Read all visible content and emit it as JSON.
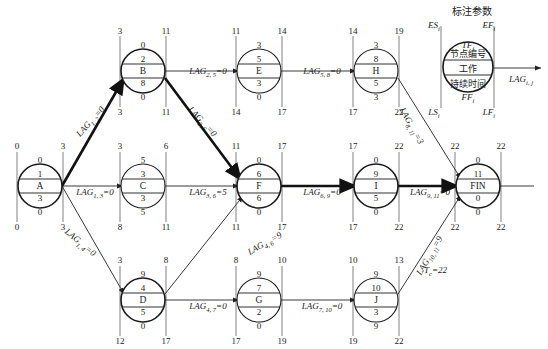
{
  "diagram": {
    "title_cn": "标注参数",
    "project_duration_label": "T",
    "project_duration_sub": "c",
    "project_duration_text": "T",
    "project_duration_value": "=22",
    "legend": {
      "es": "ES",
      "es_sub": "i",
      "ef": "EF",
      "ef_sub": "i",
      "tf": "TF",
      "tf_sub": "i",
      "ff": "FF",
      "ff_sub": "i",
      "ls": "LS",
      "ls_sub": "i",
      "lf": "LF",
      "lf_sub": "i",
      "node_id": "节点编号",
      "work": "工作",
      "duration": "持续时间",
      "lag": "LAG",
      "lag_sub": "i, j"
    },
    "nodes": [
      {
        "key": "A",
        "name": "A",
        "id": "1",
        "duration": "3",
        "tf": "0",
        "ff": "0",
        "es": "0",
        "ef": "3",
        "ls": "0",
        "lf": "3",
        "cx": 40,
        "cy": 186
      },
      {
        "key": "B",
        "name": "B",
        "id": "2",
        "duration": "8",
        "tf": "0",
        "ff": "0",
        "es": "3",
        "ef": "11",
        "ls": "3",
        "lf": "11",
        "cx": 143,
        "cy": 71
      },
      {
        "key": "C",
        "name": "C",
        "id": "3",
        "duration": "3",
        "tf": "5",
        "ff": "5",
        "es": "3",
        "ef": "6",
        "ls": "8",
        "lf": "11",
        "cx": 143,
        "cy": 186
      },
      {
        "key": "D",
        "name": "D",
        "id": "4",
        "duration": "5",
        "tf": "9",
        "ff": "0",
        "es": "3",
        "ef": "8",
        "ls": "12",
        "lf": "17",
        "cx": 143,
        "cy": 300
      },
      {
        "key": "E",
        "name": "E",
        "id": "5",
        "duration": "3",
        "tf": "3",
        "ff": "0",
        "es": "11",
        "ef": "14",
        "ls": "14",
        "lf": "17",
        "cx": 259,
        "cy": 71
      },
      {
        "key": "F",
        "name": "F",
        "id": "6",
        "duration": "6",
        "tf": "0",
        "ff": "0",
        "es": "11",
        "ef": "17",
        "ls": "11",
        "lf": "17",
        "cx": 259,
        "cy": 186
      },
      {
        "key": "G",
        "name": "G",
        "id": "7",
        "duration": "2",
        "tf": "9",
        "ff": "0",
        "es": "8",
        "ef": "10",
        "ls": "17",
        "lf": "19",
        "cx": 259,
        "cy": 300
      },
      {
        "key": "H",
        "name": "H",
        "id": "8",
        "duration": "5",
        "tf": "3",
        "ff": "3",
        "es": "14",
        "ef": "19",
        "ls": "17",
        "lf": "22",
        "cx": 376,
        "cy": 71
      },
      {
        "key": "I",
        "name": "I",
        "id": "9",
        "duration": "5",
        "tf": "0",
        "ff": "0",
        "es": "17",
        "ef": "22",
        "ls": "17",
        "lf": "22",
        "cx": 376,
        "cy": 186
      },
      {
        "key": "J",
        "name": "J",
        "id": "10",
        "duration": "3",
        "tf": "9",
        "ff": "9",
        "es": "10",
        "ef": "13",
        "ls": "19",
        "lf": "22",
        "cx": 376,
        "cy": 300
      },
      {
        "key": "FIN",
        "name": "FIN",
        "id": "11",
        "duration": "0",
        "tf": "0",
        "ff": "0",
        "es": "22",
        "ef": "22",
        "ls": "22",
        "lf": "22",
        "cx": 478,
        "cy": 186
      }
    ],
    "lags": [
      {
        "key": "lag-1-2",
        "text": "LAG",
        "sub": "1, 2",
        "value": "=0",
        "x": 91,
        "y": 122,
        "rot": -48
      },
      {
        "key": "lag-1-3",
        "text": "LAG",
        "sub": "1, 3",
        "value": "=0",
        "x": 95,
        "y": 193,
        "rot": 0
      },
      {
        "key": "lag-1-4",
        "text": "LAG",
        "sub": "1, 4",
        "value": "=0",
        "x": 80,
        "y": 243,
        "rot": 40
      },
      {
        "key": "lag-2-5",
        "text": "LAG",
        "sub": "2, 5",
        "value": "=0",
        "x": 208,
        "y": 72,
        "rot": 0
      },
      {
        "key": "lag-2-6",
        "text": "LAG",
        "sub": "2, 6",
        "value": "=0",
        "x": 202,
        "y": 122,
        "rot": 47
      },
      {
        "key": "lag-3-6",
        "text": "LAG",
        "sub": "3, 6",
        "value": "=5",
        "x": 208,
        "y": 193,
        "rot": 0
      },
      {
        "key": "lag-4-6",
        "text": "LAG",
        "sub": "4, 6",
        "value": "=9",
        "x": 265,
        "y": 244,
        "rot": -29
      },
      {
        "key": "lag-4-7",
        "text": "LAG",
        "sub": "4, 7",
        "value": "=0",
        "x": 208,
        "y": 307,
        "rot": 0
      },
      {
        "key": "lag-5-8",
        "text": "LAG",
        "sub": "5, 8",
        "value": "=0",
        "x": 322,
        "y": 72,
        "rot": 0
      },
      {
        "key": "lag-6-9",
        "text": "LAG",
        "sub": "6, 9",
        "value": "=0",
        "x": 322,
        "y": 193,
        "rot": 0
      },
      {
        "key": "lag-7-10",
        "text": "LAG",
        "sub": "7, 10",
        "value": "=0",
        "x": 322,
        "y": 307,
        "rot": 0
      },
      {
        "key": "lag-8-11",
        "text": "LAG",
        "sub": "8, 11",
        "value": "=3",
        "x": 411,
        "y": 126,
        "rot": 61
      },
      {
        "key": "lag-9-11",
        "text": "LAG",
        "sub": "9, 11",
        "value": "=0",
        "x": 430,
        "y": 193,
        "rot": 0
      },
      {
        "key": "lag-10-11",
        "text": "LAG",
        "sub": "10, 11",
        "value": "=9",
        "x": 430,
        "y": 256,
        "rot": -60
      }
    ]
  }
}
